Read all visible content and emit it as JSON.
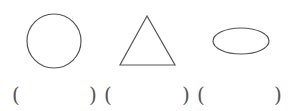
{
  "shapes": [
    {
      "type": "circle",
      "label": "circle"
    },
    {
      "type": "triangle",
      "label": "triangle"
    },
    {
      "type": "ellipse",
      "label": "ellipse"
    }
  ],
  "answers": [
    {
      "open": "(",
      "value": "",
      "close": ")"
    },
    {
      "open": "(",
      "value": "",
      "close": ")"
    },
    {
      "open": "(",
      "value": "",
      "close": ")"
    }
  ],
  "colors": {
    "stroke": "#555555"
  }
}
